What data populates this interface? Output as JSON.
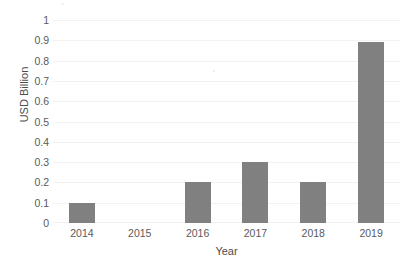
{
  "chart_data": {
    "type": "bar",
    "title": "",
    "xlabel": "Year",
    "ylabel": "USD Billion",
    "categories": [
      "2014",
      "2015",
      "2016",
      "2017",
      "2018",
      "2019"
    ],
    "values": [
      0.1,
      0,
      0.2,
      0.3,
      0.2,
      0.89
    ],
    "series": [
      {
        "name": "USD Billion",
        "values": [
          0.1,
          0,
          0.2,
          0.3,
          0.2,
          0.89
        ]
      }
    ],
    "ylim": [
      0,
      1
    ],
    "ytick_labels": [
      "1",
      "0.9",
      "0.8",
      "0.7",
      "0.6",
      "0.5",
      "0.4",
      "0.3",
      "0.2",
      "0.1",
      "0"
    ],
    "ytick_values": [
      1,
      0.9,
      0.8,
      0.7,
      0.6,
      0.5,
      0.4,
      0.3,
      0.2,
      0.1,
      0
    ],
    "grid": true,
    "grid_axis": "y",
    "legend": false,
    "legend_position": "none",
    "bar_color": "#808080",
    "gridline_color": "#f2f2f2",
    "text_color": "#5a5a5a",
    "background_color": "#ffffff"
  },
  "axes": {
    "y_title": "USD Billion",
    "x_title": "Year"
  }
}
